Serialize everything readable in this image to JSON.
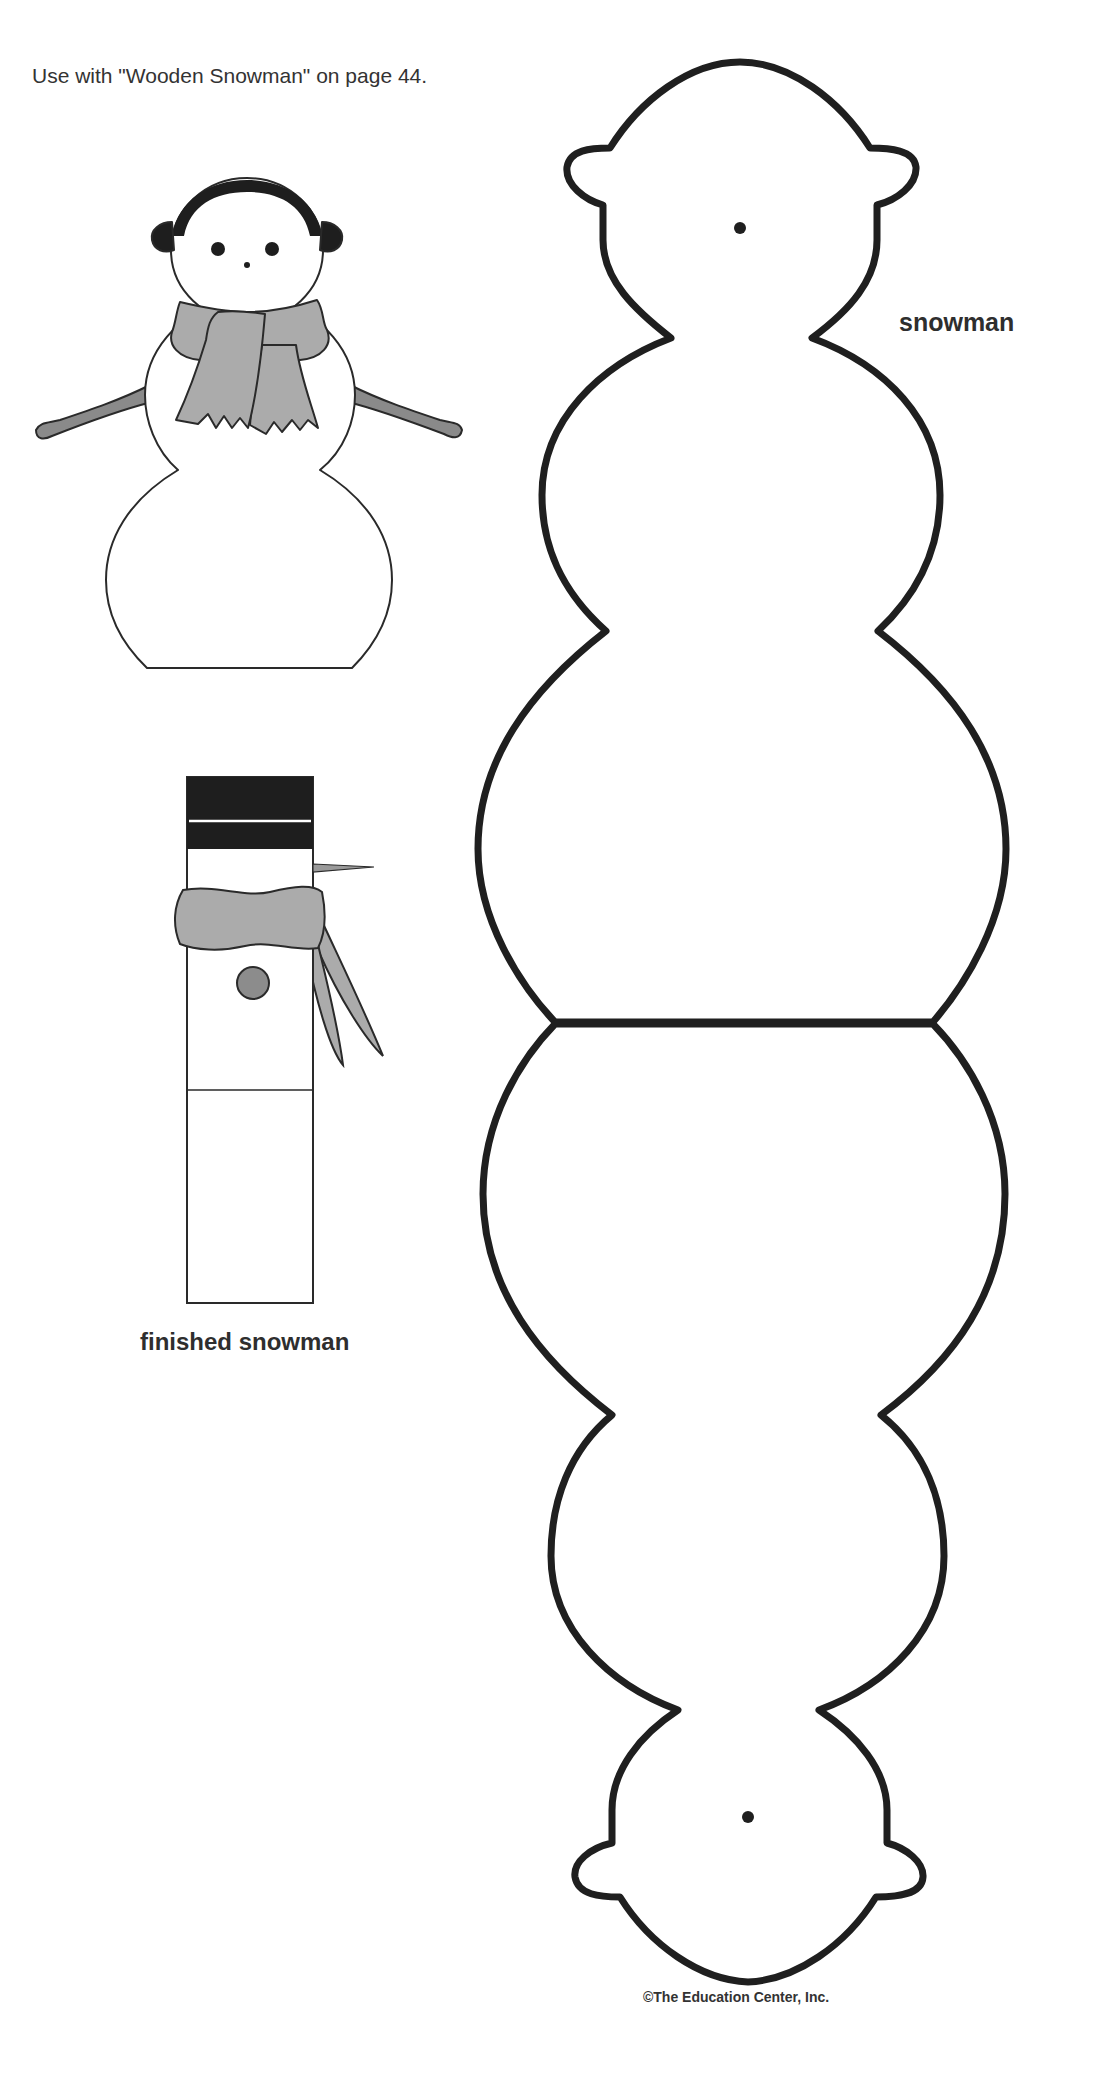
{
  "page": {
    "instruction": "Use with \"Wooden Snowman\" on page 44.",
    "copyright": "©The Education Center, Inc."
  },
  "illustrations": {
    "example_snowman": {
      "icon": "snowman-with-earmuffs-and-scarf-icon"
    },
    "finished_snowman": {
      "label": "finished snowman",
      "icon": "wooden-block-snowman-icon"
    },
    "pattern": {
      "label": "snowman",
      "icon": "snowman-cutout-pattern-icon"
    }
  },
  "colors": {
    "outline": "#2a2a2a",
    "scarf_gray": "#ababab",
    "arm_gray": "#8a8a8a",
    "hat_black": "#1e1e1e",
    "button_gray": "#8c8c8c",
    "paper": "#ffffff"
  }
}
